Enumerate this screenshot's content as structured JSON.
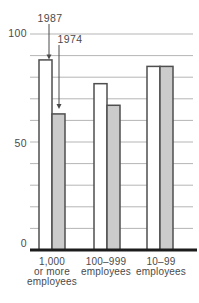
{
  "chart_data": {
    "type": "bar",
    "title": "",
    "xlabel": "",
    "ylabel": "",
    "categories": [
      "1,000 or more employees",
      "100–999 employees",
      "10–99 employees"
    ],
    "category_lines": [
      [
        "1,000",
        "or more",
        "employees"
      ],
      [
        "100–999",
        "employees"
      ],
      [
        "10–99",
        "employees"
      ]
    ],
    "series": [
      {
        "name": "1987",
        "values": [
          88,
          77,
          85
        ],
        "fill": "#ffffff"
      },
      {
        "name": "1974",
        "values": [
          63,
          67,
          85
        ],
        "fill": "#cbcbcb"
      }
    ],
    "ylim": [
      0,
      100
    ],
    "y_tick_interval": 10,
    "y_labeled_ticks": [
      100,
      50,
      0
    ],
    "y_tick_labels": [
      "100",
      "50",
      "0"
    ],
    "grid": true,
    "legend_position": "none",
    "annotations": [
      {
        "label": "1987",
        "series": "1987",
        "category_index": 0
      },
      {
        "label": "1974",
        "series": "1974",
        "category_index": 0
      }
    ],
    "colors": {
      "bar_outline": "#4f4f4f",
      "grid": "#b5b5b5",
      "axis": "#1c1c1c",
      "text": "#4a4a4a",
      "arrow": "#4a4a4a",
      "background": "#ffffff"
    }
  }
}
